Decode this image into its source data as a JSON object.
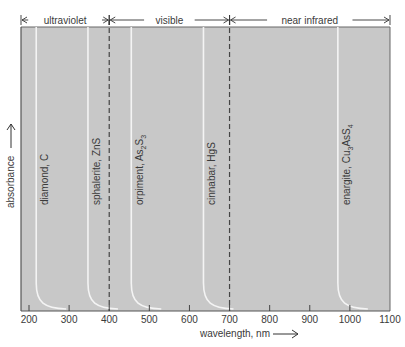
{
  "chart_data": {
    "type": "line",
    "title": "",
    "xlabel": "wavelength, nm",
    "ylabel": "absorbance",
    "xlim": [
      180,
      1100
    ],
    "xticks": [
      200,
      300,
      400,
      500,
      600,
      700,
      800,
      900,
      1000,
      1100
    ],
    "grid": false,
    "regions": [
      {
        "label": "ultraviolet",
        "from": 180,
        "to": 400
      },
      {
        "label": "visible",
        "from": 400,
        "to": 700
      },
      {
        "label": "near infrared",
        "from": 700,
        "to": 1100
      }
    ],
    "region_boundaries": [
      400,
      700
    ],
    "series": [
      {
        "name": "diamond, C",
        "label_main": "diamond, C",
        "absorption_edge_nm": 218
      },
      {
        "name": "sphalerite, ZnS",
        "label_main": "sphalerite, ZnS",
        "absorption_edge_nm": 347
      },
      {
        "name": "orpiment, As2S3",
        "label_main": "orpiment, As",
        "sub1": "2",
        "mid": "S",
        "sub2": "3",
        "absorption_edge_nm": 455
      },
      {
        "name": "cinnabar, HgS",
        "label_main": "cinnabar, HgS",
        "absorption_edge_nm": 635
      },
      {
        "name": "enargite, Cu3AsS4",
        "label_main": "enargite, Cu",
        "sub1": "3",
        "mid": "AsS",
        "sub2": "4",
        "absorption_edge_nm": 970
      }
    ],
    "colors": {
      "plot_background": "#c8c8c8",
      "curve": "#f4f4f4",
      "axis": "#555555",
      "text": "#3a3a3a"
    }
  }
}
